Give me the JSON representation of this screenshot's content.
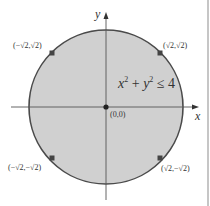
{
  "figure": {
    "inequality": {
      "x_var": "x",
      "y_var": "y",
      "exp": "2",
      "plus": " + ",
      "rel": " ≤ 4"
    },
    "axes": {
      "x_label": "x",
      "y_label": "y"
    },
    "points": {
      "origin": "(0,0)",
      "upper_right": "(√2,√2)",
      "upper_left": "(−√2,√2)",
      "lower_left": "(−√2,−√2)",
      "lower_right": "(√2,−√2)"
    },
    "colors": {
      "disk_fill": "#cfcfcf",
      "circle_stroke": "#4a4a4a",
      "axis": "#555555",
      "point": "#3d3d3d",
      "border": "#9a9a9a"
    }
  }
}
